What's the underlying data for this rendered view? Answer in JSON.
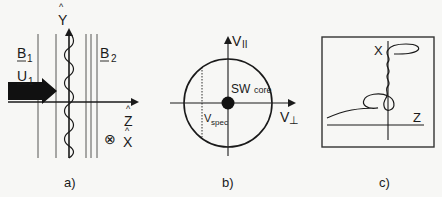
{
  "panels": [
    {
      "id": "a",
      "caption": "a)",
      "labels": {
        "b1": "B",
        "b1_sub": "1",
        "u1": "U",
        "u1_sub": "1",
        "b2": "B",
        "b2_sub": "2",
        "y_axis": "Y",
        "y_hat": "^",
        "z_axis": "Z",
        "z_hat": "^",
        "x_axis": "X",
        "x_hat": "^",
        "into_page_symbol": "⊗"
      }
    },
    {
      "id": "b",
      "caption": "b)",
      "labels": {
        "v_parallel": "V",
        "v_parallel_sub": "II",
        "v_perp": "V",
        "v_perp_sub": "⊥",
        "sw_core": "SW",
        "sw_core_sub": "core",
        "v_spec": "V",
        "v_spec_sub": "spec"
      }
    },
    {
      "id": "c",
      "caption": "c)",
      "labels": {
        "x_axis": "X",
        "z_axis": "Z"
      }
    }
  ],
  "colors": {
    "ink": "#1a1a1a",
    "thin_line": "#444444",
    "background": "#f7f7f5"
  }
}
